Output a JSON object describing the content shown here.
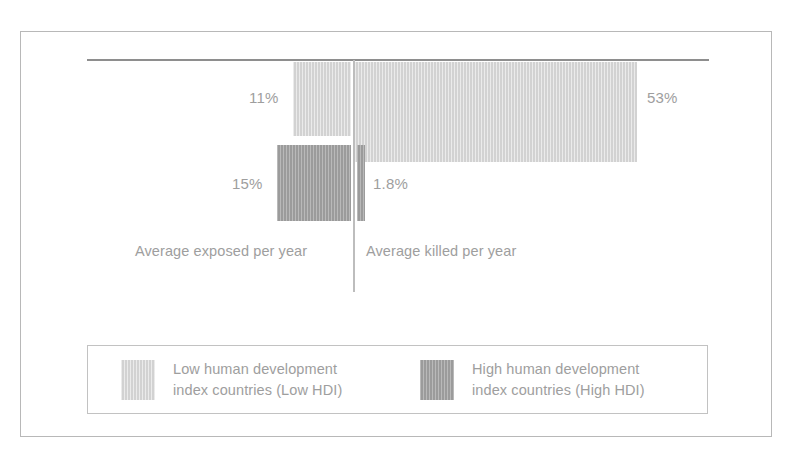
{
  "chart_data": {
    "type": "bar",
    "title": "",
    "subtitle": "",
    "xlabel": "",
    "ylabel": "",
    "orientation": "downward-hanging",
    "grid": false,
    "legend_position": "bottom",
    "categories": [
      "Average exposed per year",
      "Average killed per year"
    ],
    "series": [
      {
        "name": "Low human development index countries (Low HDI)",
        "color": "#d2d2d2",
        "values": [
          11,
          53
        ],
        "value_labels": [
          "11%",
          "53%"
        ]
      },
      {
        "name": "High human development index countries (High HDI)",
        "color": "#9b9b9b",
        "values": [
          15,
          1.8
        ],
        "value_labels": [
          "15%",
          "1.8%"
        ]
      }
    ],
    "units": "percent",
    "ylim": [
      0,
      60
    ]
  },
  "plot": {
    "categories": {
      "exposed": "Average exposed per year",
      "killed": "Average killed per year"
    },
    "labels": {
      "low_exposed": "11%",
      "low_killed": "53%",
      "high_exposed": "15%",
      "high_killed": "1.8%"
    }
  },
  "legend": {
    "entries": [
      {
        "line1": "Low human development",
        "line2": "index countries (Low HDI)",
        "color": "#d2d2d2"
      },
      {
        "line1": "High human development",
        "line2": "index countries (High HDI)",
        "color": "#9b9b9b"
      }
    ]
  },
  "colors": {
    "low_hdi": "#d2d2d2",
    "high_hdi": "#9b9b9b",
    "rule": "#8e8e8e",
    "frame": "#b8b8b8",
    "text": "#9e9e9e"
  }
}
